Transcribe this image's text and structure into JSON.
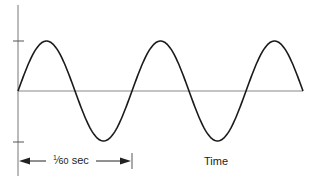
{
  "diagram": {
    "title": "",
    "type": "sine-wave",
    "period_label": "1⁄60 sec",
    "period_label_num": "1",
    "period_label_den": "60",
    "period_label_unit": " sec",
    "x_axis_label": "Time",
    "colors": {
      "line": "#1a1a1a",
      "axis": "#777777",
      "background": "#ffffff"
    }
  },
  "chart_data": {
    "type": "line",
    "title": "",
    "xlabel": "Time",
    "ylabel": "",
    "cycles_shown": 2.5,
    "period": "1/60 sec",
    "y_ticks": [
      "+peak",
      "0",
      "-peak"
    ],
    "ylim": [
      -1,
      1
    ],
    "grid": false
  }
}
